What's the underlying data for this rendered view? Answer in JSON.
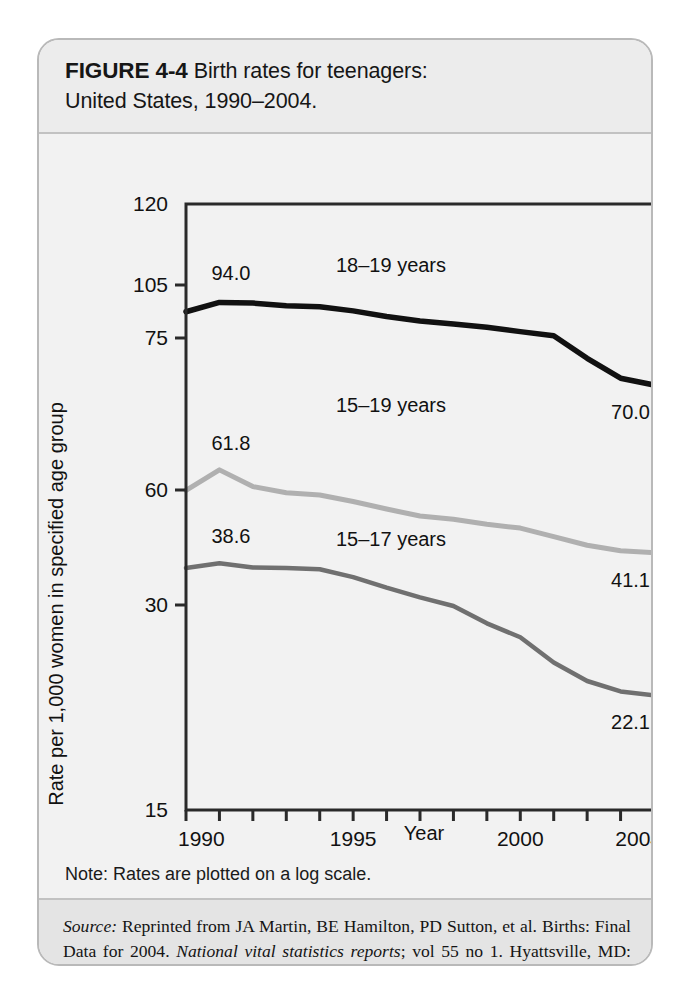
{
  "figure": {
    "label": "FIGURE 4-4",
    "title": "Birth rates for teenagers:",
    "subtitle": "United States, 1990–2004.",
    "note": "Note: Rates are plotted on a log scale.",
    "source_prefix": "Source:",
    "source_part1": " Reprinted from JA Martin, BE Hamilton, PD Sutton, et al. Births: Final Data for 2004. ",
    "source_italic": "National vital statistics reports",
    "source_part2": "; vol 55 no 1. Hyattsville, MD: National Center for Health Statistics; 2006:6."
  },
  "chart_data": {
    "type": "line",
    "xlabel": "Year",
    "ylabel": "Rate per 1,000 women in specified age group",
    "note": "Rates are plotted on a log scale.",
    "scale": "log",
    "grid": false,
    "legend": "inline-labels",
    "x": [
      1990,
      1991,
      1992,
      1993,
      1994,
      1995,
      1996,
      1997,
      1998,
      1999,
      2000,
      2001,
      2002,
      2003,
      2004
    ],
    "xlim": [
      1990,
      2004
    ],
    "xticks": [
      1990,
      1995,
      2000,
      2004
    ],
    "xtick_labels": [
      "1990",
      "1995",
      "2000",
      "2004"
    ],
    "ylim": [
      15,
      120
    ],
    "yticks": [
      15,
      30,
      60,
      75,
      105,
      120
    ],
    "ytick_labels": [
      "15",
      "30",
      "60",
      "75",
      "105",
      "120"
    ],
    "series": [
      {
        "name": "18–19 years",
        "label": "18–19 years",
        "color": "#111111",
        "start_value_label": "94.0",
        "end_value_label": "70.0",
        "values": [
          88.6,
          94.0,
          93.6,
          92.1,
          91.5,
          89.1,
          86.0,
          83.6,
          82.0,
          80.3,
          78.1,
          76.1,
          72.8,
          70.7,
          70.0
        ]
      },
      {
        "name": "15–19 years",
        "label": "15–19 years",
        "color": "#b0b0b0",
        "start_value_label": "61.8",
        "end_value_label": "41.1",
        "values": [
          59.9,
          61.8,
          60.3,
          59.0,
          58.2,
          56.0,
          53.5,
          51.3,
          50.3,
          48.8,
          47.7,
          45.3,
          43.0,
          41.6,
          41.1
        ]
      },
      {
        "name": "15–17 years",
        "label": "15–17 years",
        "color": "#707070",
        "start_value_label": "38.6",
        "end_value_label": "22.1",
        "values": [
          37.5,
          38.6,
          37.6,
          37.5,
          37.2,
          35.5,
          33.3,
          31.4,
          29.9,
          28.2,
          26.9,
          24.7,
          23.2,
          22.4,
          22.1
        ]
      }
    ]
  }
}
